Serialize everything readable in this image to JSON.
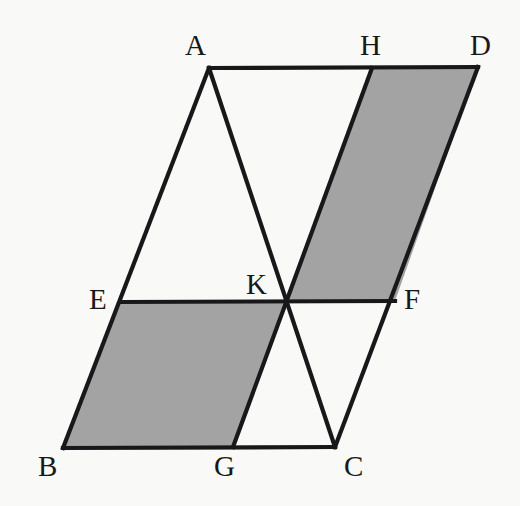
{
  "figure": {
    "background_color": "#f9f9f7",
    "stroke_color": "#18181a",
    "shade_color": "#a3a3a3",
    "stroke_width": 4.2,
    "canvas": {
      "width": 520,
      "height": 506
    }
  },
  "points": {
    "A": {
      "label": "A",
      "x": 209,
      "y": 68,
      "label_x": 185,
      "label_y": 31
    },
    "B": {
      "label": "B",
      "x": 63,
      "y": 448,
      "label_x": 38,
      "label_y": 452
    },
    "C": {
      "label": "C",
      "x": 335,
      "y": 447,
      "label_x": 344,
      "label_y": 452
    },
    "D": {
      "label": "D",
      "x": 478,
      "y": 67,
      "label_x": 470,
      "label_y": 31
    },
    "E": {
      "label": "E",
      "x": 121,
      "y": 302,
      "label_x": 89,
      "label_y": 285
    },
    "F": {
      "label": "F",
      "x": 395,
      "y": 301,
      "label_x": 404,
      "label_y": 285
    },
    "G": {
      "label": "G",
      "x": 233,
      "y": 447,
      "label_x": 214,
      "label_y": 452
    },
    "H": {
      "label": "H",
      "x": 372,
      "y": 68,
      "label_x": 360,
      "label_y": 31
    },
    "K": {
      "label": "K",
      "x": 284,
      "y": 302,
      "label_x": 246,
      "label_y": 270
    }
  },
  "shaded_regions": [
    {
      "name": "region-ebgk",
      "vertices": [
        "E",
        "B",
        "G",
        "K"
      ]
    },
    {
      "name": "region-khdf",
      "vertices": [
        "K",
        "H",
        "D",
        "F"
      ]
    }
  ],
  "segments": [
    {
      "name": "segment-ad",
      "from": "A",
      "to": "D"
    },
    {
      "name": "segment-dc",
      "from": "D",
      "to": "C"
    },
    {
      "name": "segment-cb",
      "from": "C",
      "to": "B"
    },
    {
      "name": "segment-ba",
      "from": "B",
      "to": "A"
    },
    {
      "name": "segment-ef",
      "from": "E",
      "to": "F"
    },
    {
      "name": "segment-ac",
      "from": "A",
      "to": "C"
    },
    {
      "name": "segment-hg",
      "from": "H",
      "to": "G"
    }
  ],
  "label_order": [
    "A",
    "H",
    "D",
    "E",
    "K",
    "F",
    "B",
    "G",
    "C"
  ]
}
